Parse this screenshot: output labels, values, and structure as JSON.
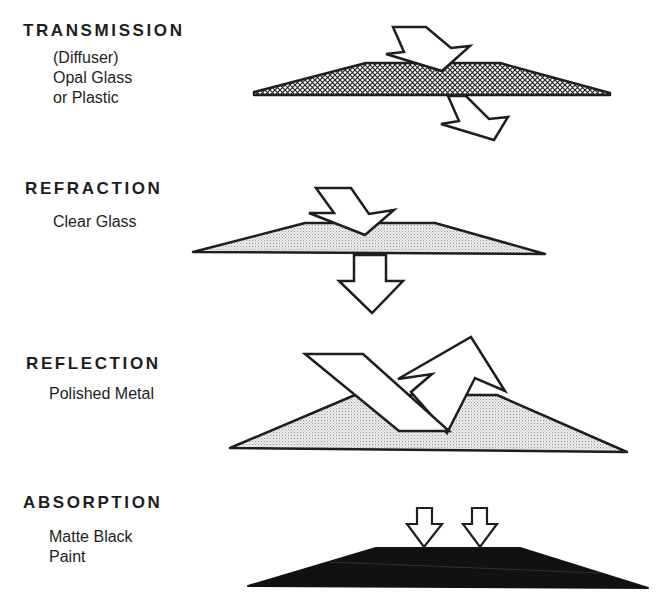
{
  "sections": [
    {
      "title": "TRANSMISSION",
      "description": "(Diffuser)\nOpal Glass\nor Plastic",
      "material_fill": "crosshatch"
    },
    {
      "title": "REFRACTION",
      "description": "Clear Glass",
      "material_fill": "light-stipple"
    },
    {
      "title": "REFLECTION",
      "description": "Polished Metal",
      "material_fill": "light-stipple"
    },
    {
      "title": "ABSORPTION",
      "description": "Matte Black\nPaint",
      "material_fill": "solid-black"
    }
  ],
  "colors": {
    "ink": "#1e1e1e",
    "stipple": "#d8d8d8",
    "absorber": "#111111",
    "background": "#ffffff"
  }
}
